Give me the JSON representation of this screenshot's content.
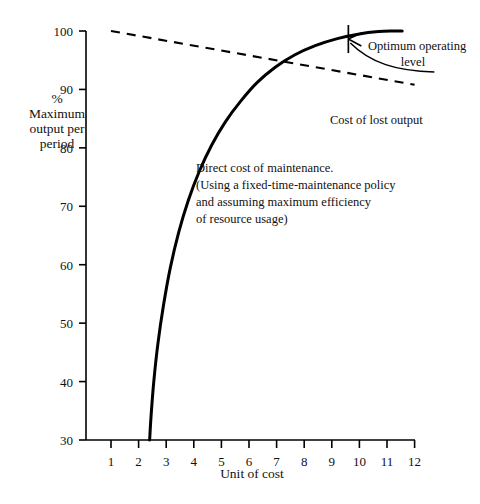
{
  "chart_data": {
    "type": "line",
    "title": "",
    "xlabel": "Unit of cost",
    "ylabel": "% Maximum output per period",
    "ylabel_lines": [
      "%",
      "Maximum",
      "output per",
      "period"
    ],
    "xlim": [
      0,
      12
    ],
    "ylim": [
      30,
      100
    ],
    "xticks": [
      "1",
      "2",
      "3",
      "4",
      "5",
      "6",
      "7",
      "8",
      "9",
      "10",
      "11",
      "12"
    ],
    "yticks": [
      "30",
      "40",
      "50",
      "60",
      "70",
      "80",
      "90",
      "100"
    ],
    "grid": false,
    "legend": "none",
    "series": [
      {
        "name": "Direct cost of maintenance",
        "style": "solid",
        "color": "#000000",
        "x": [
          2.4,
          2.45,
          2.55,
          2.7,
          2.9,
          3.15,
          3.45,
          3.8,
          4.2,
          4.65,
          5.15,
          5.7,
          6.3,
          6.95,
          7.65,
          8.4,
          9.2,
          10.0,
          10.7,
          11.2,
          11.55
        ],
        "y": [
          30.0,
          34.0,
          40.0,
          46.5,
          53.0,
          59.5,
          65.5,
          71.0,
          76.0,
          80.5,
          84.5,
          88.0,
          91.2,
          93.8,
          95.9,
          97.5,
          98.7,
          99.5,
          99.9,
          100.0,
          100.0
        ]
      },
      {
        "name": "Cost of lost output",
        "style": "dashed",
        "color": "#000000",
        "x": [
          1.0,
          12.0
        ],
        "y": [
          100.0,
          90.8
        ]
      }
    ],
    "annotations": [
      {
        "id": "direct-cost-note",
        "lines": [
          "Direct cost of maintenance.",
          "(Using a fixed-time-maintenance policy",
          "and assuming maximum efficiency",
          "of resource usage)"
        ],
        "anchor_x": 4.2,
        "anchor_y": 76
      },
      {
        "id": "optimum-operating-level",
        "lines": [
          "Optimum operating",
          "level"
        ],
        "marker_x": 9.6,
        "marker_y": 100
      },
      {
        "id": "cost-of-lost-output",
        "lines": [
          "Cost of lost output"
        ],
        "anchor_x": 9.0,
        "anchor_y": 88
      }
    ]
  },
  "figure": {
    "axis_color": "#000000",
    "background": "#ffffff"
  }
}
